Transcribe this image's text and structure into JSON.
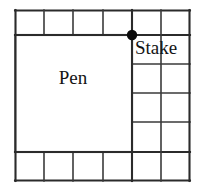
{
  "figure": {
    "background_color": "#ffffff",
    "line_color": "#3a3a3a",
    "outer_line_color": "#2b2b2b",
    "dot_color": "#0a0a0a",
    "text_color": "#141414",
    "labels": {
      "pen": "Pen",
      "stake": "Stake"
    },
    "grid": {
      "columns": 6,
      "rows": 6,
      "cell_width": 29,
      "cell_height": 29,
      "x_lines": [
        15,
        44,
        73,
        103,
        132,
        161,
        190
      ],
      "y_lines": [
        10,
        35,
        64,
        93,
        122,
        152,
        181
      ]
    },
    "pen_region": {
      "label": "Pen",
      "x": 15,
      "y": 35,
      "width": 117,
      "height": 117,
      "columns_spanned": 4,
      "rows_spanned": 4
    },
    "stake_point": {
      "label": "Stake",
      "x": 132,
      "y": 35,
      "radius": 5
    },
    "open_cells_top_row": 6,
    "open_cells_bottom_rows": 2
  }
}
